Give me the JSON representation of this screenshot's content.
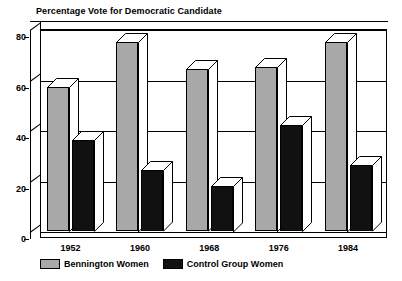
{
  "chart_data": {
    "type": "bar",
    "title": "Percentage Vote for Democratic Candidate",
    "xlabel": "",
    "ylabel": "",
    "categories": [
      "1952",
      "1960",
      "1968",
      "1976",
      "1984"
    ],
    "series": [
      {
        "name": "Bennington Women",
        "color": "#a8a8a8",
        "values": [
          57,
          75,
          64,
          65,
          75
        ]
      },
      {
        "name": "Control Group Women",
        "color": "#111111",
        "values": [
          36,
          24,
          18,
          42,
          26
        ]
      }
    ],
    "ylim": [
      0,
      80
    ],
    "yticks": [
      0,
      20,
      40,
      60,
      80
    ],
    "ytick_labels": [
      "0",
      "20",
      "40",
      "60",
      "80"
    ],
    "grid": true,
    "legend_position": "bottom-left",
    "style": "3d-bar"
  },
  "legend": {
    "entries": [
      {
        "label": "Bennington Women",
        "swatch": "gray"
      },
      {
        "label": "Control Group Women",
        "swatch": "black"
      }
    ]
  },
  "colors": {
    "series_gray": "#a8a8a8",
    "series_black": "#111111",
    "axis": "#000000",
    "background": "#ffffff"
  }
}
